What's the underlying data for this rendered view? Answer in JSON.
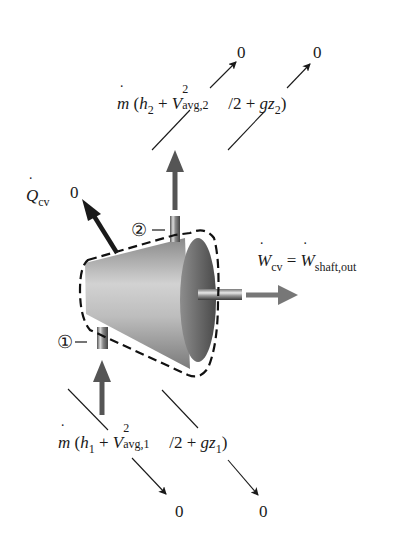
{
  "diagram": {
    "outlet_term": {
      "prefix": "m",
      "h": "h",
      "h_sub": "2",
      "plus1": "+",
      "V": "V",
      "V_sup": "2",
      "V_sub": "avg,2",
      "over": "/2",
      "plus2": "+",
      "gz": "gz",
      "z_sub": "2",
      "open": "(",
      "close": ")",
      "zero_ke": "0",
      "zero_pe": "0"
    },
    "inlet_term": {
      "prefix": "m",
      "h": "h",
      "h_sub": "1",
      "plus1": "+",
      "V": "V",
      "V_sup": "2",
      "V_sub": "avg,1",
      "over": "/2",
      "plus2": "+",
      "gz": "gz",
      "z_sub": "1",
      "open": "(",
      "close": ")",
      "zero_ke": "0",
      "zero_pe": "0"
    },
    "heat": {
      "symbol": "Q",
      "sub": "cv",
      "zero": "0"
    },
    "work": {
      "lhs": "W",
      "lhs_sub": "cv",
      "equals": "=",
      "rhs": "W",
      "rhs_sub": "shaft,out"
    },
    "state_labels": {
      "inlet": "①",
      "outlet": "②"
    },
    "colors": {
      "ink": "#1a1a1a",
      "flow_arrow": "#5a5a5a",
      "body_light": "#c8c8c8",
      "body_dark": "#6a6a6a",
      "end_face": "#555555"
    }
  }
}
